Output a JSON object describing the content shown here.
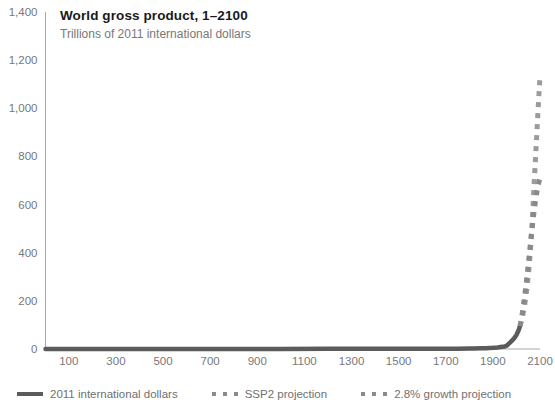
{
  "chart_data": {
    "type": "line",
    "title": "World gross product, 1–2100",
    "subtitle": "Trillions of 2011 international dollars",
    "xlabel": "",
    "ylabel": "",
    "xlim": [
      1,
      2100
    ],
    "ylim": [
      0,
      1400
    ],
    "grid": false,
    "legend_position": "bottom",
    "y_ticks": [
      "0",
      "200",
      "400",
      "600",
      "800",
      "1,000",
      "1,200",
      "1,400"
    ],
    "y_tick_values": [
      0,
      200,
      400,
      600,
      800,
      1000,
      1200,
      1400
    ],
    "x_ticks": [
      "100",
      "300",
      "500",
      "700",
      "900",
      "1100",
      "1300",
      "1500",
      "1700",
      "1900",
      "2100"
    ],
    "x_tick_values": [
      100,
      300,
      500,
      700,
      900,
      1100,
      1300,
      1500,
      1700,
      1900,
      2100
    ],
    "series": [
      {
        "name": "2011 international dollars",
        "style": "solid",
        "color": "#5b5b5b",
        "x": [
          1,
          200,
          400,
          600,
          800,
          1000,
          1200,
          1300,
          1400,
          1500,
          1600,
          1700,
          1750,
          1800,
          1820,
          1850,
          1870,
          1900,
          1920,
          1940,
          1950,
          1960,
          1970,
          1980,
          1990,
          2000,
          2010,
          2015
        ],
        "values": [
          0.2,
          0.3,
          0.3,
          0.3,
          0.4,
          0.5,
          0.6,
          0.6,
          0.6,
          0.7,
          0.9,
          1.1,
          1.3,
          1.7,
          1.9,
          2.6,
          3.4,
          5.0,
          6.5,
          9.0,
          10.0,
          15.0,
          24.0,
          34.0,
          44.0,
          58.0,
          80.0,
          95.0
        ]
      },
      {
        "name": "SSP2 projection",
        "style": "dotted",
        "color": "#8a8a8a",
        "x": [
          2015,
          2020,
          2025,
          2030,
          2035,
          2040,
          2045,
          2050,
          2055,
          2060,
          2065,
          2070,
          2075,
          2080,
          2085,
          2090,
          2095,
          2100
        ],
        "values": [
          95,
          120,
          150,
          185,
          222,
          262,
          305,
          350,
          398,
          445,
          490,
          532,
          572,
          608,
          642,
          670,
          692,
          710
        ]
      },
      {
        "name": "2.8% growth projection",
        "style": "dotted",
        "color": "#8a8a8a",
        "x": [
          2015,
          2020,
          2025,
          2030,
          2035,
          2040,
          2045,
          2050,
          2055,
          2060,
          2065,
          2070,
          2075,
          2080,
          2085,
          2090,
          2095,
          2100
        ],
        "values": [
          95,
          112,
          132,
          156,
          184,
          217,
          256,
          302,
          356,
          420,
          495,
          584,
          688,
          772,
          868,
          960,
          1050,
          1130
        ]
      }
    ]
  },
  "legend": {
    "items": [
      {
        "label": "2011 international dollars",
        "marker": "solid-line"
      },
      {
        "label": "SSP2 projection",
        "marker": "dotted-line"
      },
      {
        "label": "2.8% growth projection",
        "marker": "dotted-line"
      }
    ]
  },
  "colors": {
    "line_solid": "#5b5b5b",
    "line_dotted": "#8a8a8a",
    "axis": "#a9a9a9",
    "tick_text": "#77787a",
    "title_text": "#1a1a1a",
    "subtitle_text": "#77787a",
    "background": "#ffffff"
  }
}
